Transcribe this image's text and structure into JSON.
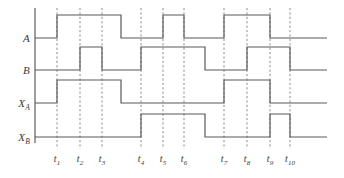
{
  "figure": {
    "background_color": "#ffffff",
    "line_color": "#595959",
    "axis_color": "#4d4d4d",
    "guide_color": "#8c8c8c",
    "text_color": "#3a3a3a",
    "width": 344,
    "height": 178
  },
  "axes": {
    "origin_x": 35,
    "right_x": 327,
    "top_y": 8,
    "bottom_y": 137,
    "pulse_height": 23
  },
  "signals": [
    {
      "name": "A",
      "label": "A",
      "subscript": "",
      "baseline_y": 38,
      "pulses": [
        {
          "start": 57,
          "end": 121
        },
        {
          "start": 163,
          "end": 184
        },
        {
          "start": 224,
          "end": 270
        }
      ]
    },
    {
      "name": "B",
      "label": "B",
      "subscript": "",
      "baseline_y": 70,
      "pulses": [
        {
          "start": 80,
          "end": 102
        },
        {
          "start": 141,
          "end": 205
        },
        {
          "start": 247,
          "end": 290
        }
      ]
    },
    {
      "name": "XA",
      "label": "X",
      "subscript": "A",
      "baseline_y": 103,
      "pulses": [
        {
          "start": 57,
          "end": 121
        },
        {
          "start": 224,
          "end": 270
        }
      ]
    },
    {
      "name": "XB",
      "label": "X",
      "subscript": "B",
      "baseline_y": 137,
      "pulses": [
        {
          "start": 141,
          "end": 205
        },
        {
          "start": 270,
          "end": 290
        }
      ]
    }
  ],
  "time_markers": [
    {
      "label": "t",
      "subscript": "1",
      "x": 57,
      "guide_top": 8,
      "guide_bottom": 149
    },
    {
      "label": "t",
      "subscript": "2",
      "x": 80,
      "guide_top": 8,
      "guide_bottom": 149
    },
    {
      "label": "t",
      "subscript": "3",
      "x": 102,
      "guide_top": 8,
      "guide_bottom": 149
    },
    {
      "label": "t",
      "subscript": "4",
      "x": 141,
      "guide_top": 8,
      "guide_bottom": 149
    },
    {
      "label": "t",
      "subscript": "5",
      "x": 163,
      "guide_top": 8,
      "guide_bottom": 149
    },
    {
      "label": "t",
      "subscript": "6",
      "x": 184,
      "guide_top": 8,
      "guide_bottom": 149
    },
    {
      "label": "t",
      "subscript": "7",
      "x": 224,
      "guide_top": 8,
      "guide_bottom": 149
    },
    {
      "label": "t",
      "subscript": "8",
      "x": 247,
      "guide_top": 8,
      "guide_bottom": 149
    },
    {
      "label": "t",
      "subscript": "9",
      "x": 270,
      "guide_top": 8,
      "guide_bottom": 149
    },
    {
      "label": "t",
      "subscript": "10",
      "x": 290,
      "guide_top": 8,
      "guide_bottom": 149
    }
  ],
  "tick_label_y": 153,
  "signal_label_x": 30
}
